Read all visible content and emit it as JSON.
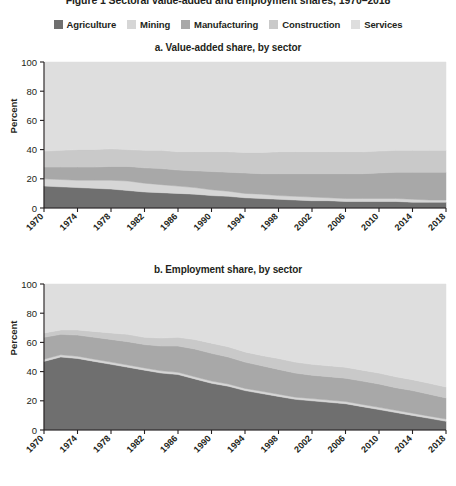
{
  "top_title": "Figure 1  Sectoral value-added and employment shares, 1970–2018",
  "legend": {
    "items": [
      {
        "label": "Agriculture",
        "color": "#6f6f6f"
      },
      {
        "label": "Mining",
        "color": "#d6d6d6"
      },
      {
        "label": "Manufacturing",
        "color": "#a8a8a8"
      },
      {
        "label": "Construction",
        "color": "#c9c9c9"
      },
      {
        "label": "Services",
        "color": "#dedede"
      }
    ]
  },
  "panels": [
    {
      "key": "a",
      "title": "a. Value-added share, by sector",
      "ylabel": "Percent"
    },
    {
      "key": "b",
      "title": "b. Employment share, by sector",
      "ylabel": "Percent"
    }
  ],
  "chart_data": [
    {
      "type": "area",
      "stacked": true,
      "title": "a. Value-added share, by sector",
      "xlabel": "",
      "ylabel": "Percent",
      "ylim": [
        0,
        100
      ],
      "xlim": [
        1970,
        2018
      ],
      "grid": false,
      "legend_position": "top",
      "x": [
        1970,
        1972,
        1974,
        1976,
        1978,
        1980,
        1982,
        1984,
        1986,
        1988,
        1990,
        1992,
        1994,
        1996,
        1998,
        2000,
        2002,
        2004,
        2006,
        2008,
        2010,
        2012,
        2014,
        2016,
        2018
      ],
      "tick_labels": [
        "1970",
        "1974",
        "1978",
        "1982",
        "1986",
        "1990",
        "1994",
        "1998",
        "2002",
        "2006",
        "2010",
        "2014",
        "2018"
      ],
      "series": [
        {
          "name": "Agriculture",
          "color": "#6f6f6f",
          "values": [
            15,
            14.5,
            14,
            13.5,
            13,
            12,
            11,
            10.5,
            10,
            9.5,
            8.5,
            8,
            7,
            6.5,
            6,
            5.5,
            5,
            5,
            4.5,
            4.5,
            4.5,
            4.5,
            4,
            4,
            4
          ]
        },
        {
          "name": "Mining",
          "color": "#d6d6d6",
          "values": [
            5,
            5,
            5,
            5.5,
            6,
            6.5,
            6,
            5.5,
            5,
            4.5,
            4,
            3.5,
            3,
            3,
            2.5,
            2.5,
            2.5,
            2,
            2,
            2,
            2,
            2,
            2,
            1.5,
            1.5
          ]
        },
        {
          "name": "Manufacturing",
          "color": "#a8a8a8",
          "values": [
            8,
            8.5,
            9,
            9,
            9.5,
            10,
            10.5,
            11,
            11,
            11.5,
            12.5,
            13,
            14,
            14,
            15,
            15.5,
            16,
            16.5,
            17,
            17,
            17.5,
            18,
            18.5,
            19,
            19
          ]
        },
        {
          "name": "Construction",
          "color": "#c9c9c9",
          "values": [
            11,
            11.5,
            12,
            12,
            12,
            11.5,
            12,
            12.5,
            12.5,
            13,
            13.5,
            14,
            14,
            14.5,
            15,
            15,
            15,
            15,
            15,
            15,
            15,
            15,
            15,
            15,
            15
          ]
        },
        {
          "name": "Services",
          "color": "#dedede",
          "values": [
            61,
            60.5,
            60,
            60,
            59.5,
            60,
            60.5,
            60.5,
            61.5,
            61.5,
            61.5,
            61.5,
            62,
            62,
            61.5,
            61.5,
            61.5,
            61.5,
            61.5,
            61.5,
            61,
            60.5,
            60.5,
            60.5,
            60.5
          ]
        }
      ]
    },
    {
      "type": "area",
      "stacked": true,
      "title": "b. Employment share, by sector",
      "xlabel": "",
      "ylabel": "Percent",
      "ylim": [
        0,
        100
      ],
      "xlim": [
        1970,
        2018
      ],
      "grid": false,
      "legend_position": "top",
      "x": [
        1970,
        1972,
        1974,
        1976,
        1978,
        1980,
        1982,
        1984,
        1986,
        1988,
        1990,
        1992,
        1994,
        1996,
        1998,
        2000,
        2002,
        2004,
        2006,
        2008,
        2010,
        2012,
        2014,
        2016,
        2018
      ],
      "tick_labels": [
        "1970",
        "1974",
        "1978",
        "1982",
        "1986",
        "1990",
        "1994",
        "1998",
        "2002",
        "2006",
        "2010",
        "2014",
        "2018"
      ],
      "series": [
        {
          "name": "Agriculture",
          "color": "#6f6f6f",
          "values": [
            47,
            50,
            49,
            47,
            45,
            43,
            41,
            39,
            38,
            35,
            32,
            30,
            27,
            25,
            23,
            21,
            20,
            19,
            18,
            16,
            14,
            12,
            10,
            8,
            6
          ]
        },
        {
          "name": "Mining",
          "color": "#d6d6d6",
          "values": [
            1.5,
            1.5,
            1.5,
            1.5,
            1.5,
            1.5,
            1.5,
            1.5,
            1.5,
            1.5,
            1.5,
            1.5,
            1.5,
            1.5,
            1.5,
            1.5,
            1.5,
            1.5,
            1.5,
            1.5,
            1.5,
            1.5,
            1.5,
            1.5,
            1.5
          ]
        },
        {
          "name": "Manufacturing",
          "color": "#a8a8a8",
          "values": [
            15,
            14,
            14.5,
            15,
            15.5,
            16,
            16,
            17,
            18,
            19,
            19,
            18.5,
            18,
            17.5,
            17,
            16.5,
            16,
            16,
            16,
            16,
            16,
            15.5,
            15.5,
            15,
            14.5
          ]
        },
        {
          "name": "Construction",
          "color": "#c9c9c9",
          "values": [
            3,
            3,
            3.5,
            4,
            4.5,
            5,
            5,
            5.5,
            6,
            6.5,
            7,
            7,
            7,
            7,
            7.5,
            7.5,
            7.5,
            7.5,
            7.5,
            7.5,
            7.5,
            7.5,
            7.5,
            7.5,
            7.5
          ]
        },
        {
          "name": "Services",
          "color": "#dedede",
          "values": [
            33.5,
            31.5,
            31.5,
            32.5,
            33.5,
            34.5,
            36.5,
            37,
            36.5,
            38,
            40.5,
            43,
            46.5,
            49,
            51,
            53.5,
            55,
            56,
            57,
            59,
            61,
            63.5,
            65.5,
            68,
            70.5
          ]
        }
      ]
    }
  ]
}
